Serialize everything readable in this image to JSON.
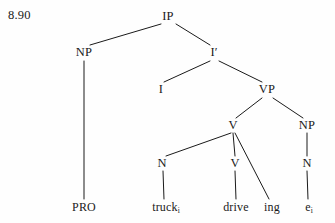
{
  "figure": {
    "example_number": "8.90",
    "type": "x-bar-syntax-tree",
    "ink_color": "#1a1a1a",
    "background_color": "#fefefe"
  },
  "nodes": {
    "ip": {
      "label": "IP",
      "x": 168,
      "y": 16
    },
    "np_subject": {
      "label": "NP",
      "x": 84,
      "y": 52
    },
    "i_bar": {
      "label": "I′",
      "x": 214,
      "y": 52
    },
    "i_head": {
      "label": "I",
      "x": 161,
      "y": 89
    },
    "vp": {
      "label": "VP",
      "x": 267,
      "y": 89
    },
    "v_upper": {
      "label": "V",
      "x": 233,
      "y": 125
    },
    "np_object": {
      "label": "NP",
      "x": 307,
      "y": 125
    },
    "n_incorporated": {
      "label": "N",
      "x": 162,
      "y": 163
    },
    "v_lower": {
      "label": "V",
      "x": 235,
      "y": 163
    },
    "n_object": {
      "label": "N",
      "x": 307,
      "y": 163
    }
  },
  "terminals": {
    "pro": {
      "text": "PRO",
      "subscript": "",
      "x": 84,
      "y": 207
    },
    "truck": {
      "text": "truck",
      "subscript": "i",
      "x": 166,
      "y": 207
    },
    "drive": {
      "text": "drive",
      "subscript": "",
      "x": 236,
      "y": 207
    },
    "ing": {
      "text": "ing",
      "subscript": "",
      "x": 272,
      "y": 207
    },
    "trace": {
      "text": "e",
      "subscript": "i",
      "x": 309,
      "y": 207
    }
  },
  "edges": [
    {
      "name": "ip-to-np",
      "from": "ip",
      "to": "np_subject"
    },
    {
      "name": "ip-to-i-bar",
      "from": "ip",
      "to": "i_bar"
    },
    {
      "name": "np-to-pro",
      "from": "np_subject",
      "to": "pro"
    },
    {
      "name": "i-bar-to-i",
      "from": "i_bar",
      "to": "i_head"
    },
    {
      "name": "i-bar-to-vp",
      "from": "i_bar",
      "to": "vp"
    },
    {
      "name": "vp-to-v",
      "from": "vp",
      "to": "v_upper"
    },
    {
      "name": "vp-to-np",
      "from": "vp",
      "to": "np_object"
    },
    {
      "name": "v-to-n",
      "from": "v_upper",
      "to": "n_incorporated"
    },
    {
      "name": "v-to-v",
      "from": "v_upper",
      "to": "v_lower"
    },
    {
      "name": "v-to-ing",
      "from": "v_upper",
      "to": "ing"
    },
    {
      "name": "n-to-truck",
      "from": "n_incorporated",
      "to": "truck"
    },
    {
      "name": "v-to-drive",
      "from": "v_lower",
      "to": "drive"
    },
    {
      "name": "np-object-to-n",
      "from": "np_object",
      "to": "n_object"
    },
    {
      "name": "n-object-to-trace",
      "from": "n_object",
      "to": "trace"
    }
  ]
}
